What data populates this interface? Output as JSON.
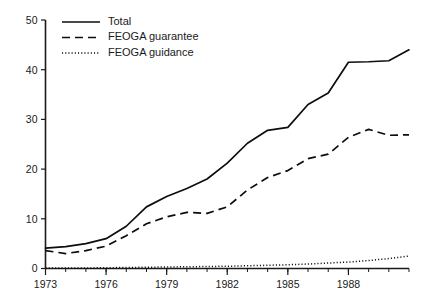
{
  "chart_data": {
    "type": "line",
    "title": "",
    "subtitle": "",
    "xlabel": "",
    "ylabel": "",
    "xlim": [
      1973,
      1991
    ],
    "ylim": [
      0,
      50
    ],
    "grid": false,
    "legend_position": "top-left",
    "y_ticks": [
      "0",
      "10",
      "20",
      "30",
      "40",
      "50"
    ],
    "y_tick_values": [
      0,
      10,
      20,
      30,
      40,
      50
    ],
    "x_ticks": [
      "1973",
      "1976",
      "1979",
      "1982",
      "1985",
      "1988"
    ],
    "x_tick_values": [
      1973,
      1976,
      1979,
      1982,
      1985,
      1988
    ],
    "x_minor_interval": 1,
    "x": [
      1973,
      1974,
      1975,
      1976,
      1977,
      1978,
      1979,
      1980,
      1981,
      1982,
      1983,
      1984,
      1985,
      1986,
      1987,
      1988,
      1989,
      1990,
      1991
    ],
    "series": [
      {
        "name": "Total",
        "style": "solid",
        "color": "#0d0d0d",
        "values": [
          4.1,
          4.4,
          5.0,
          6.0,
          8.5,
          12.4,
          14.5,
          16.1,
          18.0,
          21.2,
          25.2,
          27.8,
          28.4,
          33.0,
          35.3,
          41.5,
          41.6,
          41.8,
          44.0
        ]
      },
      {
        "name": "FEOGA guarantee",
        "style": "dashed",
        "color": "#0d0d0d",
        "values": [
          3.6,
          3.0,
          3.6,
          4.5,
          6.6,
          9.0,
          10.4,
          11.3,
          11.1,
          12.4,
          15.8,
          18.3,
          19.7,
          22.1,
          23.0,
          26.4,
          28.0,
          26.8,
          26.9
        ]
      },
      {
        "name": "FEOGA guidance",
        "style": "dotted",
        "color": "#0d0d0d",
        "values": [
          0.1,
          0.1,
          0.1,
          0.15,
          0.2,
          0.25,
          0.3,
          0.35,
          0.4,
          0.45,
          0.55,
          0.65,
          0.75,
          0.9,
          1.1,
          1.3,
          1.6,
          2.0,
          2.5
        ]
      }
    ]
  },
  "legend": {
    "items": [
      {
        "label": "Total",
        "style": "solid"
      },
      {
        "label": "FEOGA guarantee",
        "style": "dashed"
      },
      {
        "label": "FEOGA guidance",
        "style": "dotted"
      }
    ]
  }
}
